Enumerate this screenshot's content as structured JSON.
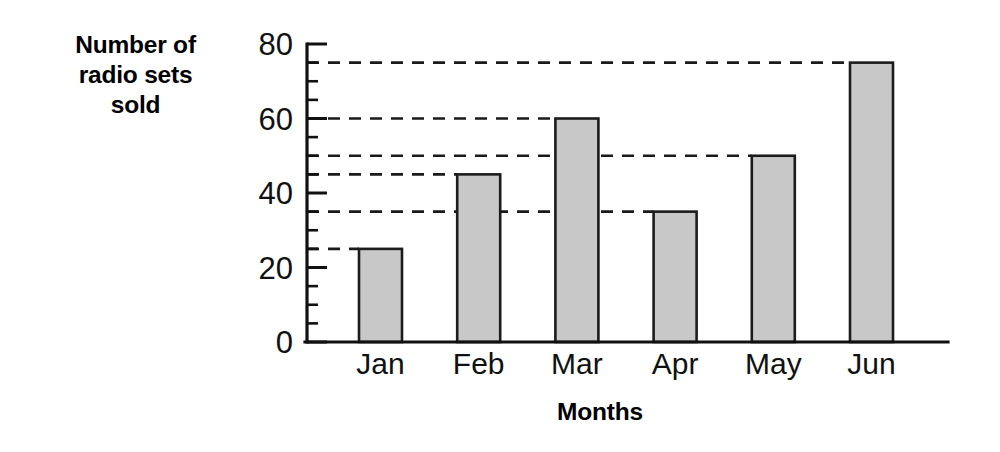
{
  "chart_data": {
    "type": "bar",
    "title": "",
    "xlabel": "Months",
    "ylabel": "Number of radio sets sold",
    "ylabel_lines": [
      "Number of",
      "radio sets",
      "sold"
    ],
    "categories": [
      "Jan",
      "Feb",
      "Mar",
      "Apr",
      "May",
      "Jun"
    ],
    "values": [
      25,
      45,
      60,
      35,
      50,
      75
    ],
    "ylim": [
      0,
      80
    ],
    "ytick_labels": [
      "0",
      "20",
      "40",
      "60",
      "80"
    ],
    "ytick_values": [
      0,
      20,
      40,
      60,
      80
    ],
    "yminor_step": 5,
    "gridlines": [
      25,
      35,
      45,
      50,
      60,
      75
    ],
    "grid": "horizontal-dashed-to-bar",
    "legend": "none",
    "bar_fill": "#c8c8c8",
    "bar_edge": "#1c1c1c",
    "axis_color": "#111111"
  }
}
